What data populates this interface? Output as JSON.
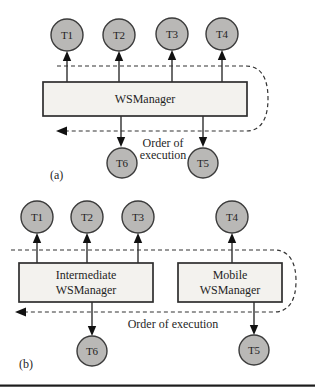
{
  "figure": {
    "panel_a": {
      "caption": "(a)",
      "top_nodes": [
        "T1",
        "T2",
        "T3",
        "T4"
      ],
      "manager_label": "WSManager",
      "bottom_nodes": [
        "T6",
        "T5"
      ],
      "order_line1": "Order of",
      "order_line2": "execution"
    },
    "panel_b": {
      "caption": "(b)",
      "top_nodes": [
        "T1",
        "T2",
        "T3"
      ],
      "mobile_top_node": "T4",
      "intermediate_manager_line1": "Intermediate",
      "intermediate_manager_line2": "WSManager",
      "mobile_manager_line1": "Mobile",
      "mobile_manager_line2": "WSManager",
      "bottom_nodes": [
        "T6",
        "T5"
      ],
      "order_label": "Order of execution"
    },
    "colors": {
      "node_fill": "#b9b8b6",
      "node_stroke": "#3b3b3b",
      "box_fill": "#f3f2ee",
      "box_stroke": "#2e2e2e",
      "line": "#2e2e2e",
      "dashed_line": "#333333",
      "bottom_rule": "#1c1c1c"
    }
  }
}
